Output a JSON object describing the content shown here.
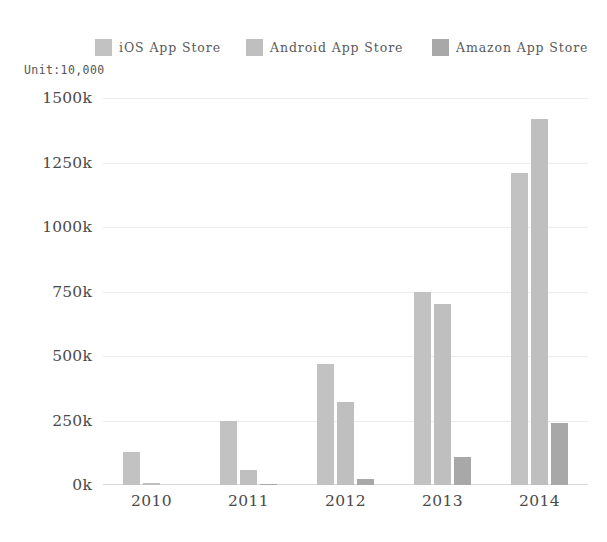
{
  "chart_data": {
    "type": "bar",
    "title": "",
    "subtitle": "",
    "unit_note": "Unit:10,000",
    "xlabel": "",
    "ylabel": "",
    "categories": [
      "2010",
      "2011",
      "2012",
      "2013",
      "2014"
    ],
    "series": [
      {
        "name": "iOS App Store",
        "color": "#c2c2c2",
        "values": [
          128,
          250,
          470,
          750,
          1210
        ]
      },
      {
        "name": "Android App Store",
        "color": "#bfbfbf",
        "values": [
          8,
          60,
          320,
          700,
          1420
        ]
      },
      {
        "name": "Amazon App Store",
        "color": "#a8a8a8",
        "values": [
          0,
          5,
          25,
          110,
          240
        ]
      }
    ],
    "ylim": [
      0,
      1500
    ],
    "yticks": [
      0,
      250,
      500,
      750,
      1000,
      1250,
      1500
    ],
    "ytick_labels": [
      "0k",
      "250k",
      "500k",
      "750k",
      "1000k",
      "1250k",
      "1500k"
    ],
    "grid": true,
    "legend_position": "top"
  },
  "legend": {
    "items": [
      {
        "label": "iOS App Store",
        "swatch_name": "legend-swatch-ios"
      },
      {
        "label": "Android App Store",
        "swatch_name": "legend-swatch-android"
      },
      {
        "label": "Amazon App Store",
        "swatch_name": "legend-swatch-amazon"
      }
    ]
  }
}
